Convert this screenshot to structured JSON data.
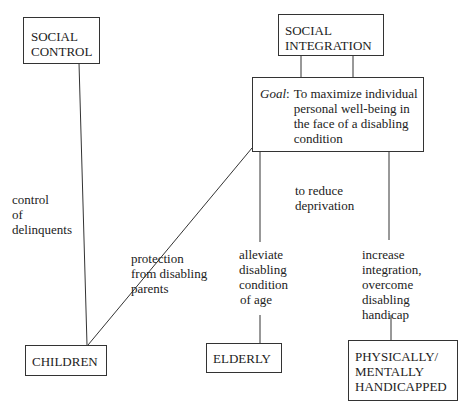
{
  "diagram": {
    "nodes": {
      "social_control": {
        "lines": [
          "SOCIAL",
          "CONTROL"
        ]
      },
      "social_integration": {
        "lines": [
          "SOCIAL",
          "INTEGRATION"
        ]
      },
      "goal": {
        "key": "Goal",
        "sep": ":",
        "lines": [
          "To maximize individual",
          "personal well-being in",
          "the face of a disabling",
          "condition"
        ]
      },
      "children": {
        "lines": [
          "CHILDREN"
        ]
      },
      "elderly": {
        "lines": [
          "ELDERLY"
        ]
      },
      "handicapped": {
        "lines": [
          "PHYSICALLY/",
          "MENTALLY",
          "HANDICAPPED"
        ]
      }
    },
    "edge_labels": {
      "control_delinquents": [
        "control",
        "of",
        "delinquents"
      ],
      "protection": [
        "protection",
        "from disabling",
        "parents"
      ],
      "reduce_deprivation": [
        "to reduce",
        "deprivation"
      ],
      "alleviate": [
        "alleviate",
        "disabling",
        "condition",
        "of age"
      ],
      "increase_integration": [
        "increase",
        "integration,",
        "overcome",
        "disabling",
        "handicap"
      ]
    },
    "edges": [
      {
        "from": "social_control",
        "to": "children",
        "label": "control of delinquents"
      },
      {
        "from": "social_integration",
        "to": "goal",
        "label": ""
      },
      {
        "from": "goal",
        "to": "children",
        "label": "protection from disabling parents"
      },
      {
        "from": "goal",
        "to": "elderly",
        "label": "alleviate disabling condition of age"
      },
      {
        "from": "goal",
        "to": "handicapped",
        "label": "increase integration, overcome disabling handicap"
      }
    ],
    "annotation": "to reduce deprivation"
  }
}
